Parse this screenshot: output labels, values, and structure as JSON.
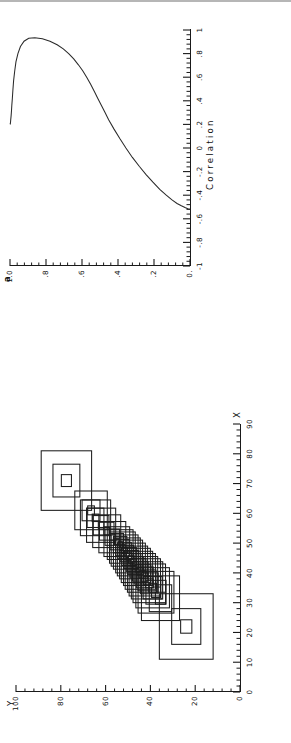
{
  "page": {
    "kind": "scanned-figure-sheet",
    "orientation": "rotated-90-ccw",
    "background": "#ffffff",
    "ink_color": "#1a1a1a"
  },
  "chart_data": [
    {
      "id": "alpha-vs-correlation",
      "type": "line",
      "title": "",
      "xlabel": "Correlation",
      "ylabel": "a",
      "ylabel_glyph": "α",
      "xlim": [
        -1,
        1
      ],
      "ylim": [
        0,
        1.0
      ],
      "grid": false,
      "legend": "none",
      "xticks": [
        -1,
        -0.8,
        -0.6,
        -0.4,
        -0.2,
        0,
        0.2,
        0.4,
        0.6,
        0.8,
        1
      ],
      "xticklabels": [
        "-1",
        "-.8",
        "-.6",
        "-.4",
        "-.2",
        "0",
        ".2",
        ".4",
        ".6",
        ".8",
        "1"
      ],
      "yticks": [
        0,
        0.2,
        0.4,
        0.6,
        0.8,
        1.0
      ],
      "yticklabels": [
        "0.",
        ".2",
        ".4",
        ".6",
        ".8",
        "1.0"
      ],
      "minor_tick_count_x": 4,
      "minor_tick_count_y": 4,
      "series": [
        {
          "name": "alpha profile",
          "comment": "single continuous C-shaped locus; lower branch rises from (-0.52,0) to the nose, upper branch returns to (1,1)",
          "x": [
            -0.52,
            -0.515,
            -0.505,
            -0.49,
            -0.47,
            -0.44,
            -0.4,
            -0.35,
            -0.29,
            -0.225,
            -0.155,
            -0.08,
            0.0,
            0.08,
            0.16,
            0.24,
            0.3,
            0.36,
            0.42,
            0.48,
            0.54,
            0.6,
            0.655,
            0.705,
            0.755,
            0.8,
            0.84,
            0.875,
            0.905,
            0.925,
            0.935,
            0.93,
            0.905,
            0.86,
            0.8,
            0.73,
            0.65,
            0.57,
            0.49,
            0.42,
            0.36,
            0.31,
            0.27,
            0.24,
            0.22,
            0.208,
            0.202,
            0.2
          ],
          "y": [
            0.0,
            0.012,
            0.028,
            0.048,
            0.072,
            0.1,
            0.132,
            0.168,
            0.206,
            0.244,
            0.282,
            0.32,
            0.356,
            0.39,
            0.422,
            0.452,
            0.472,
            0.492,
            0.512,
            0.532,
            0.552,
            0.574,
            0.596,
            0.62,
            0.646,
            0.674,
            0.704,
            0.738,
            0.778,
            0.82,
            0.862,
            0.896,
            0.922,
            0.942,
            0.956,
            0.967,
            0.974,
            0.98,
            0.984,
            0.987,
            0.99,
            0.992,
            0.994,
            0.996,
            0.997,
            0.998,
            0.999,
            1.0
          ],
          "nose_x": 0.935,
          "nose_y": 0.862,
          "start_point": [
            -0.52,
            0.0
          ],
          "end_point": [
            0.2,
            1.0
          ]
        }
      ]
    },
    {
      "id": "nested-confidence-rectangles",
      "type": "scatter",
      "marker": "nested-rectangles",
      "title": "",
      "xlabel": "X",
      "ylabel": "Y",
      "xlim": [
        0,
        90
      ],
      "ylim": [
        0,
        100
      ],
      "grid": false,
      "legend": "none",
      "xticks": [
        0,
        10,
        20,
        30,
        40,
        50,
        60,
        70,
        80,
        90
      ],
      "xticklabels": [
        "0",
        "10",
        "20",
        "30",
        "40",
        "50",
        "60",
        "70",
        "80",
        "90"
      ],
      "yticks": [
        0,
        20,
        40,
        60,
        80,
        100
      ],
      "yticklabels": [
        "0",
        "20",
        "40",
        "60",
        "80",
        "100"
      ],
      "minor_tick_count_x": 4,
      "minor_tick_count_y": 4,
      "boxes": [
        {
          "cx": 22.0,
          "cy": 24.0,
          "w": [
            22.0,
            12.0,
            4.5
          ],
          "h": [
            24.0,
            13.0,
            5.0
          ]
        },
        {
          "cx": 31.5,
          "cy": 35.5,
          "w": [
            15.0,
            9.0,
            4.0
          ],
          "h": [
            17.0,
            10.0,
            4.5
          ]
        },
        {
          "cx": 33.5,
          "cy": 37.5,
          "w": [
            14.0,
            8.0,
            3.5
          ],
          "h": [
            16.0,
            9.0,
            4.0
          ]
        },
        {
          "cx": 35.0,
          "cy": 39.0,
          "w": [
            13.5,
            7.5,
            3.0
          ],
          "h": [
            15.0,
            8.5,
            3.5
          ]
        },
        {
          "cx": 36.5,
          "cy": 40.5,
          "w": [
            13.0,
            7.0,
            3.0
          ],
          "h": [
            14.5,
            8.0,
            3.5
          ]
        },
        {
          "cx": 37.5,
          "cy": 41.5,
          "w": [
            12.5,
            7.0,
            3.0
          ],
          "h": [
            14.0,
            8.0,
            3.0
          ]
        },
        {
          "cx": 38.5,
          "cy": 42.5,
          "w": [
            12.5,
            7.0,
            3.0
          ],
          "h": [
            14.0,
            7.5,
            3.0
          ]
        },
        {
          "cx": 39.5,
          "cy": 43.5,
          "w": [
            12.0,
            6.5,
            2.5
          ],
          "h": [
            13.5,
            7.5,
            3.0
          ]
        },
        {
          "cx": 40.5,
          "cy": 44.5,
          "w": [
            12.0,
            6.5,
            2.5
          ],
          "h": [
            13.5,
            7.0,
            3.0
          ]
        },
        {
          "cx": 41.5,
          "cy": 45.5,
          "w": [
            11.5,
            6.5,
            2.5
          ],
          "h": [
            13.0,
            7.0,
            2.5
          ]
        },
        {
          "cx": 42.5,
          "cy": 46.5,
          "w": [
            11.5,
            6.0,
            2.5
          ],
          "h": [
            13.0,
            7.0,
            2.5
          ]
        },
        {
          "cx": 43.5,
          "cy": 47.5,
          "w": [
            11.0,
            6.0,
            2.5
          ],
          "h": [
            12.5,
            6.5,
            2.5
          ]
        },
        {
          "cx": 44.5,
          "cy": 48.5,
          "w": [
            11.0,
            6.0,
            2.5
          ],
          "h": [
            12.5,
            6.5,
            2.5
          ]
        },
        {
          "cx": 45.5,
          "cy": 49.5,
          "w": [
            11.0,
            6.0,
            2.5
          ],
          "h": [
            12.0,
            6.5,
            2.5
          ]
        },
        {
          "cx": 46.5,
          "cy": 50.5,
          "w": [
            10.5,
            5.5,
            2.0
          ],
          "h": [
            12.0,
            6.0,
            2.5
          ]
        },
        {
          "cx": 47.5,
          "cy": 51.5,
          "w": [
            10.5,
            5.5,
            2.0
          ],
          "h": [
            12.0,
            6.0,
            2.5
          ]
        },
        {
          "cx": 48.5,
          "cy": 52.5,
          "w": [
            10.5,
            5.5,
            2.0
          ],
          "h": [
            11.5,
            6.0,
            2.5
          ]
        },
        {
          "cx": 49.5,
          "cy": 53.5,
          "w": [
            10.0,
            5.5,
            2.0
          ],
          "h": [
            11.5,
            6.0,
            2.0
          ]
        },
        {
          "cx": 50.5,
          "cy": 55.0,
          "w": [
            10.0,
            5.5,
            2.0
          ],
          "h": [
            11.5,
            6.0,
            2.0
          ]
        },
        {
          "cx": 52.0,
          "cy": 57.0,
          "w": [
            10.5,
            5.5,
            2.0
          ],
          "h": [
            12.0,
            6.5,
            2.5
          ]
        },
        {
          "cx": 54.0,
          "cy": 59.5,
          "w": [
            11.0,
            6.0,
            2.5
          ],
          "h": [
            12.5,
            6.5,
            2.5
          ]
        },
        {
          "cx": 56.0,
          "cy": 62.0,
          "w": [
            11.5,
            6.5,
            2.5
          ],
          "h": [
            13.0,
            7.0,
            2.5
          ]
        },
        {
          "cx": 58.5,
          "cy": 64.5,
          "w": [
            12.0,
            6.5,
            2.5
          ],
          "h": [
            13.5,
            7.5,
            3.0
          ]
        },
        {
          "cx": 61.0,
          "cy": 66.5,
          "w": [
            13.0,
            7.0,
            3.0
          ],
          "h": [
            14.5,
            8.0,
            3.0
          ]
        },
        {
          "cx": 71.0,
          "cy": 77.5,
          "w": [
            20.0,
            11.0,
            4.0
          ],
          "h": [
            22.5,
            12.0,
            4.5
          ]
        }
      ]
    }
  ]
}
